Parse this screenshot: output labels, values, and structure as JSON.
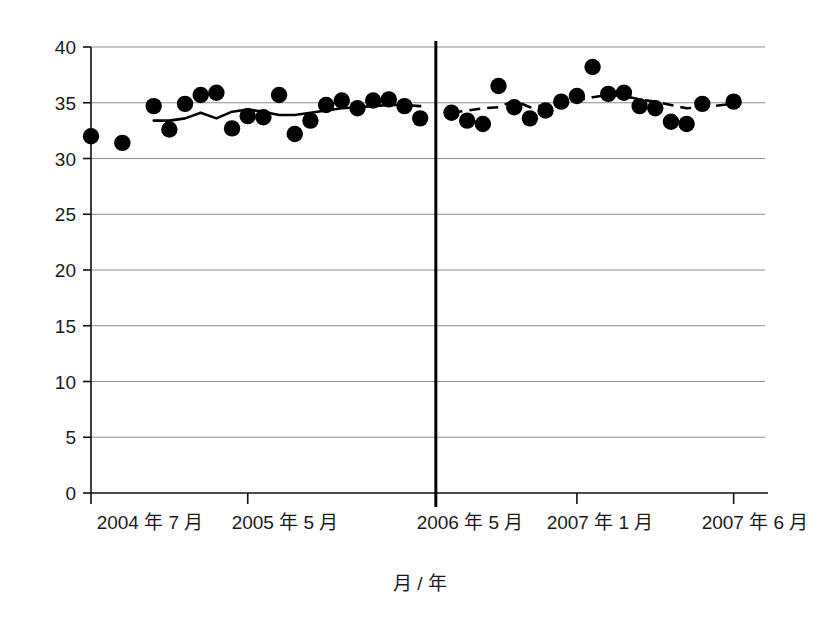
{
  "chart_data": {
    "type": "scatter",
    "title": "",
    "subtitle": "",
    "xlabel": "月 / 年",
    "ylabel": "",
    "ylim": [
      0,
      40
    ],
    "ytick_values": [
      0,
      5,
      10,
      15,
      20,
      25,
      30,
      35,
      40
    ],
    "ytick_labels": [
      "0",
      "5",
      "10",
      "15",
      "20",
      "25",
      "30",
      "35",
      "40"
    ],
    "grid": "horizontal",
    "legend": "none",
    "xtick_labels": [
      "2004 年 7 月",
      "2005 年 5 月",
      "2006 年 5 月",
      "2007 年 1 月",
      "2007 年 6 月"
    ],
    "xtick_indices": [
      0,
      10,
      22,
      31,
      41
    ],
    "x_index_range": [
      0,
      43
    ],
    "annotations": [
      {
        "name": "period-divider",
        "x_index": 22,
        "label": ""
      }
    ],
    "series": [
      {
        "name": "observed-points-period-1",
        "style": "scatter",
        "marker": "filled-circle",
        "color": "#000000",
        "x": [
          0,
          2,
          4,
          5,
          6,
          7,
          8,
          9,
          10,
          11,
          12,
          13,
          14,
          15,
          16,
          17,
          18,
          19,
          20,
          21
        ],
        "values": [
          32.0,
          31.4,
          34.7,
          32.6,
          34.9,
          35.7,
          35.9,
          32.7,
          33.8,
          33.7,
          35.7,
          32.2,
          33.4,
          34.8,
          35.2,
          34.5,
          35.2,
          35.3,
          34.7,
          33.6
        ]
      },
      {
        "name": "trend-line-period-1",
        "style": "line",
        "linestyle": "solid",
        "color": "#000000",
        "x": [
          4,
          5,
          6,
          7,
          8,
          9,
          10,
          11,
          12,
          13,
          14,
          15,
          16,
          17,
          18,
          19,
          20,
          21
        ],
        "values": [
          33.4,
          33.4,
          33.6,
          34.1,
          33.6,
          34.2,
          34.4,
          34.2,
          33.9,
          33.9,
          34.1,
          34.3,
          34.5,
          34.6,
          34.7,
          34.8,
          34.8,
          34.7
        ]
      },
      {
        "name": "observed-points-period-2",
        "style": "scatter",
        "marker": "filled-circle",
        "color": "#000000",
        "x": [
          23,
          24,
          25,
          26,
          27,
          28,
          29,
          30,
          31,
          32,
          33,
          34,
          35,
          36,
          37,
          38,
          39,
          41
        ],
        "values": [
          34.1,
          33.4,
          33.1,
          36.5,
          34.6,
          33.6,
          34.3,
          35.1,
          35.6,
          38.2,
          35.8,
          35.9,
          34.7,
          34.5,
          33.3,
          33.1,
          34.9,
          35.1
        ]
      },
      {
        "name": "trend-line-period-2",
        "style": "line",
        "linestyle": "dashed",
        "color": "#000000",
        "x": [
          23,
          24,
          25,
          26,
          27,
          28,
          29,
          30,
          31,
          32,
          33,
          34,
          35,
          36,
          37,
          38,
          39,
          41
        ],
        "values": [
          34.1,
          34.3,
          34.5,
          34.6,
          35.2,
          34.6,
          34.8,
          35.0,
          35.2,
          35.5,
          35.7,
          35.6,
          35.3,
          35.1,
          34.8,
          34.5,
          34.6,
          34.9
        ]
      }
    ]
  },
  "axis": {
    "x_title": "月 / 年"
  }
}
